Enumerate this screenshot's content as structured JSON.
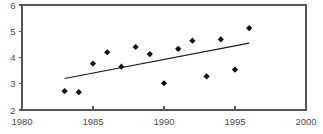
{
  "chart_data": {
    "type": "scatter",
    "title": "",
    "subtitle": "",
    "xlabel": "",
    "ylabel": "",
    "xlim": [
      1980,
      2000
    ],
    "ylim": [
      2,
      6
    ],
    "grid": false,
    "legend": null,
    "x_ticks": [
      1980,
      1985,
      1990,
      1995,
      2000
    ],
    "y_ticks": [
      2,
      3,
      4,
      5,
      6
    ],
    "x_tick_labels": [
      "1980",
      "1985",
      "1990",
      "1995",
      "2000"
    ],
    "y_tick_labels": [
      "2",
      "3",
      "4",
      "5",
      "6"
    ],
    "marker": "diamond",
    "marker_color": "#111111",
    "axis_color": "#565656",
    "trend_color": "#1a1a1a",
    "series": [
      {
        "name": "observations",
        "type": "scatter",
        "x": [
          1983,
          1984,
          1985,
          1986,
          1987,
          1988,
          1989,
          1990,
          1991,
          1992,
          1993,
          1994,
          1995,
          1996
        ],
        "values": [
          2.72,
          2.68,
          3.77,
          4.2,
          3.65,
          4.4,
          4.13,
          3.02,
          4.33,
          4.64,
          3.28,
          4.69,
          3.54,
          5.12
        ]
      },
      {
        "name": "trend-line",
        "type": "line",
        "x": [
          1983,
          1996
        ],
        "values": [
          3.2,
          4.55
        ]
      }
    ]
  }
}
